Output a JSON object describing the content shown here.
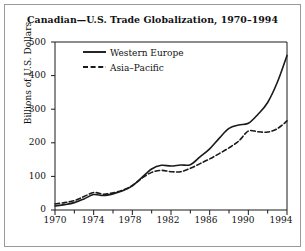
{
  "figure": {
    "title": "Canadian—U.S. Trade Globalization, 1970–1994",
    "border_color": "#9a9a9a",
    "background_color": "#ffffff",
    "ink_color": "#1a1a1a"
  },
  "axes": {
    "ylabel": "Billions of U.S. Dollars",
    "xlabel": "",
    "y_ticks": [
      "0",
      "100",
      "200",
      "300",
      "400",
      "500"
    ],
    "x_ticks": [
      "1970",
      "1974",
      "1978",
      "1982",
      "1986",
      "1990",
      "1994"
    ],
    "y_minor_present": false,
    "x_minor_interval": 2
  },
  "legend": {
    "position": "top-left-inside",
    "entries": [
      {
        "label": "Western Europe",
        "style": "solid"
      },
      {
        "label": "Asia–Pacific",
        "style": "dashed"
      }
    ]
  },
  "chart_data": {
    "type": "line",
    "title": "Canadian—U.S. Trade Globalization, 1970–1994",
    "xlabel": "",
    "ylabel": "Billions of U.S. Dollars",
    "xlim": [
      1970,
      1994
    ],
    "ylim": [
      0,
      500
    ],
    "grid": false,
    "legend": "top-left-inside",
    "x": [
      1970,
      1971,
      1972,
      1973,
      1974,
      1975,
      1976,
      1977,
      1978,
      1979,
      1980,
      1981,
      1982,
      1983,
      1984,
      1985,
      1986,
      1987,
      1988,
      1989,
      1990,
      1991,
      1992,
      1993,
      1994
    ],
    "series": [
      {
        "name": "Western Europe",
        "style": "solid",
        "color": "#1a1a1a",
        "values": [
          12,
          16,
          22,
          33,
          46,
          43,
          48,
          57,
          72,
          97,
          122,
          133,
          131,
          134,
          135,
          158,
          182,
          214,
          243,
          253,
          258,
          285,
          320,
          380,
          460
        ]
      },
      {
        "name": "Asia–Pacific",
        "style": "dashed",
        "color": "#1a1a1a",
        "values": [
          18,
          22,
          28,
          40,
          52,
          47,
          51,
          59,
          73,
          95,
          112,
          118,
          114,
          114,
          124,
          138,
          152,
          168,
          185,
          205,
          235,
          233,
          232,
          242,
          265
        ]
      }
    ]
  }
}
